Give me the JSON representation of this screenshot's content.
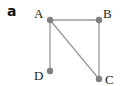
{
  "figure": {
    "panel_label": "a",
    "colors": {
      "edge": "#9a9a9a",
      "node": "#808080",
      "label": "#222222"
    },
    "nodes": [
      {
        "id": "A",
        "label": "A",
        "x": 50,
        "y": 20,
        "label_x": 34,
        "label_y": 18
      },
      {
        "id": "B",
        "label": "B",
        "x": 99,
        "y": 20,
        "label_x": 103,
        "label_y": 18
      },
      {
        "id": "C",
        "label": "C",
        "x": 99,
        "y": 79,
        "label_x": 105,
        "label_y": 84
      },
      {
        "id": "D",
        "label": "D",
        "x": 50,
        "y": 71,
        "label_x": 34,
        "label_y": 80
      }
    ],
    "edges": [
      {
        "from": "A",
        "to": "B"
      },
      {
        "from": "A",
        "to": "D"
      },
      {
        "from": "B",
        "to": "C"
      },
      {
        "from": "A",
        "to": "C"
      }
    ]
  }
}
